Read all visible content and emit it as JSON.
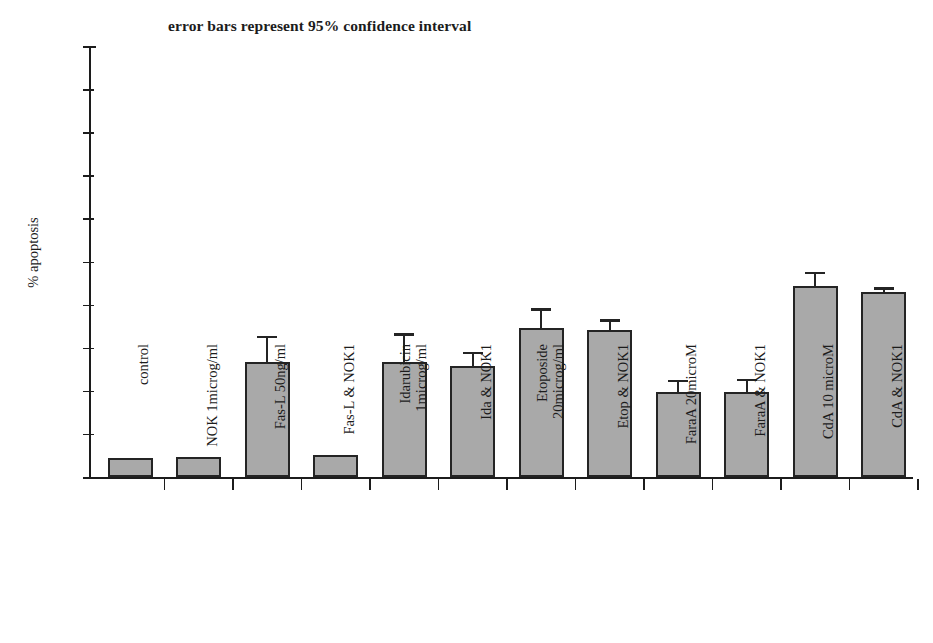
{
  "chart_data": {
    "type": "bar",
    "title": "error bars represent 95% confidence interval",
    "xlabel": "",
    "ylabel": "% apoptosis",
    "ylim": [
      0,
      100
    ],
    "ytick_step": 10,
    "yticks": [
      "100",
      "90",
      "80",
      "70",
      "60",
      "50",
      "40",
      "30",
      "20",
      "10",
      "0"
    ],
    "grid": false,
    "legend": "none",
    "error_bars": "95% confidence interval",
    "bar_color": "#a9a9a9",
    "bar_edge_color": "#242424",
    "categories": [
      "control",
      "NOK 1microg/ml",
      "Fas-L 50ng/ml",
      "Fas-L & NOK1",
      "Idarubicin 1microg/ml",
      "Ida & NOK1",
      "Etoposide 20microg/ml",
      "Etop & NOK1",
      "FaraA 20microM",
      "FaraA & NOK1",
      "CdA 10 microM",
      "CdA & NOK1"
    ],
    "category_label_lines": [
      [
        "control"
      ],
      [
        "NOK 1microg/ml"
      ],
      [
        "Fas-L 50ng/ml"
      ],
      [
        "Fas-L & NOK1"
      ],
      [
        "Idarubicin",
        "1microg/ml"
      ],
      [
        "Ida & NOK1"
      ],
      [
        "Etoposide",
        "20microg/ml"
      ],
      [
        "Etop & NOK1"
      ],
      [
        "FaraA 20microM"
      ],
      [
        "FaraA & NOK1"
      ],
      [
        "CdA 10 microM"
      ],
      [
        "CdA & NOK1"
      ]
    ],
    "values": [
      4.3,
      4.7,
      26.7,
      5.2,
      26.7,
      25.7,
      34.5,
      34.0,
      19.7,
      19.7,
      44.3,
      43.0
    ],
    "error_upper": [
      4.3,
      4.7,
      32.2,
      5.2,
      32.7,
      28.5,
      38.5,
      36.0,
      22.0,
      22.2,
      47.0,
      43.5
    ],
    "bars": [
      {
        "category": "control",
        "value": 4.3,
        "error_top": 4.3,
        "has_error_bar": false
      },
      {
        "category": "NOK 1microg/ml",
        "value": 4.7,
        "error_top": 4.7,
        "has_error_bar": false
      },
      {
        "category": "Fas-L 50ng/ml",
        "value": 26.7,
        "error_top": 32.2,
        "has_error_bar": true
      },
      {
        "category": "Fas-L & NOK1",
        "value": 5.2,
        "error_top": 5.2,
        "has_error_bar": false
      },
      {
        "category": "Idarubicin 1microg/ml",
        "value": 26.7,
        "error_top": 32.7,
        "has_error_bar": true
      },
      {
        "category": "Ida & NOK1",
        "value": 25.7,
        "error_top": 28.5,
        "has_error_bar": true
      },
      {
        "category": "Etoposide 20microg/ml",
        "value": 34.5,
        "error_top": 38.5,
        "has_error_bar": true
      },
      {
        "category": "Etop & NOK1",
        "value": 34.0,
        "error_top": 36.0,
        "has_error_bar": true
      },
      {
        "category": "FaraA 20microM",
        "value": 19.7,
        "error_top": 22.0,
        "has_error_bar": true
      },
      {
        "category": "FaraA & NOK1",
        "value": 19.7,
        "error_top": 22.2,
        "has_error_bar": true
      },
      {
        "category": "CdA 10 microM",
        "value": 44.3,
        "error_top": 47.0,
        "has_error_bar": true
      },
      {
        "category": "CdA & NOK1",
        "value": 43.0,
        "error_top": 43.5,
        "has_error_bar": true
      }
    ]
  },
  "layout": {
    "axis_left_px": 89,
    "axis_right_px": 913,
    "baseline_y_px": 477,
    "top_y_px": 46,
    "px_per_unit": 4.31,
    "bar_width_px": 45,
    "slot_width_px": 68.5,
    "first_slot_left_px": 96
  }
}
